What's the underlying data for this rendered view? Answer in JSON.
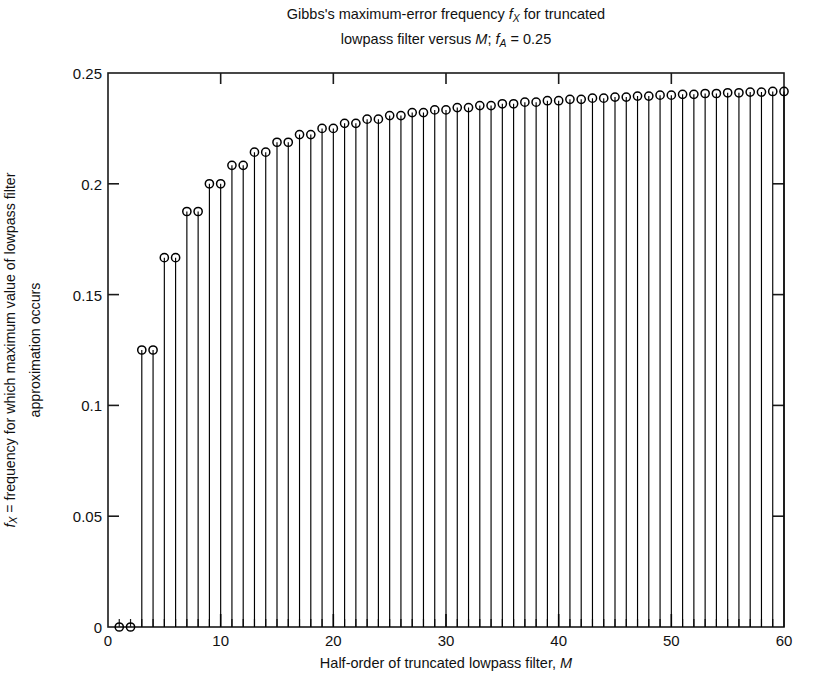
{
  "chart_data": {
    "type": "stem",
    "title_lines": [
      "Gibbs's maximum-error frequency fX for truncated",
      "lowpass filter versus M; fA = 0.25"
    ],
    "title_line1_pre": "Gibbs's maximum-error frequency ",
    "title_line1_f": "f",
    "title_line1_sub": "X",
    "title_line1_post": " for truncated",
    "title_line2_pre": "lowpass filter versus ",
    "title_line2_M": "M",
    "title_line2_mid": "; ",
    "title_line2_f": "f",
    "title_line2_sub": "A",
    "title_line2_post": " = 0.25",
    "xlabel": "Half-order of truncated lowpass filter, M",
    "xlabel_pre": "Half-order of truncated lowpass filter, ",
    "xlabel_M": "M",
    "ylabel_line1_f": "f",
    "ylabel_line1_sub": "X",
    "ylabel_line1_post": " = frequency for which maximum value of lowpass filter",
    "ylabel_line2": "approximation occurs",
    "xlim": [
      0,
      60
    ],
    "ylim": [
      0,
      0.25
    ],
    "xticks": [
      0,
      10,
      20,
      30,
      40,
      50,
      60
    ],
    "xtick_labels": [
      "0",
      "10",
      "20",
      "30",
      "40",
      "50",
      "60"
    ],
    "xminor_step": 1,
    "yticks": [
      0,
      0.05,
      0.1,
      0.15,
      0.2,
      0.25
    ],
    "ytick_labels": [
      "0",
      "0.05",
      "0.1",
      "0.15",
      "0.2",
      "0.25"
    ],
    "grid": false,
    "legend": null,
    "marker": "open-circle",
    "marker_color": "#000000",
    "line_color": "#000000",
    "background": "#ffffff",
    "x": [
      1,
      2,
      3,
      4,
      5,
      6,
      7,
      8,
      9,
      10,
      11,
      12,
      13,
      14,
      15,
      16,
      17,
      18,
      19,
      20,
      21,
      22,
      23,
      24,
      25,
      26,
      27,
      28,
      29,
      30,
      31,
      32,
      33,
      34,
      35,
      36,
      37,
      38,
      39,
      40,
      41,
      42,
      43,
      44,
      45,
      46,
      47,
      48,
      49,
      50,
      51,
      52,
      53,
      54,
      55,
      56,
      57,
      58,
      59,
      60
    ],
    "values": [
      0,
      0,
      0.125,
      0.125,
      0.16667,
      0.16667,
      0.1875,
      0.1875,
      0.2,
      0.2,
      0.20833,
      0.20833,
      0.21429,
      0.21429,
      0.21875,
      0.21875,
      0.22222,
      0.22222,
      0.225,
      0.225,
      0.22727,
      0.22727,
      0.22917,
      0.22917,
      0.23077,
      0.23077,
      0.23214,
      0.23214,
      0.23333,
      0.23333,
      0.23438,
      0.23438,
      0.23529,
      0.23529,
      0.23611,
      0.23611,
      0.23684,
      0.23684,
      0.2375,
      0.2375,
      0.2381,
      0.2381,
      0.23864,
      0.23864,
      0.23913,
      0.23913,
      0.23958,
      0.23958,
      0.24,
      0.24,
      0.24038,
      0.24038,
      0.24074,
      0.24074,
      0.24107,
      0.24107,
      0.24138,
      0.24138,
      0.24167,
      0.24167
    ]
  }
}
